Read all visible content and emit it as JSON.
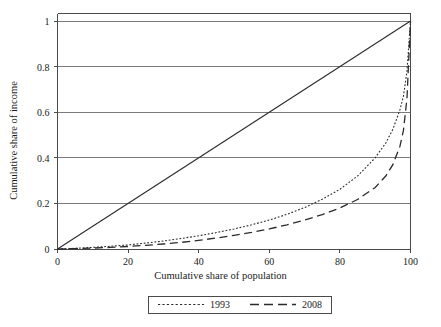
{
  "chart_data": {
    "type": "line",
    "title": "",
    "xlabel": "Cumulative share of population",
    "ylabel": "Cumulative share of income",
    "xlim": [
      0,
      100
    ],
    "ylim": [
      0,
      1
    ],
    "xticks": [
      "0",
      "20",
      "40",
      "60",
      "80",
      "100"
    ],
    "xtick_values": [
      0,
      20,
      40,
      60,
      80,
      100
    ],
    "yticks": [
      "0",
      "0.2",
      "0.4",
      "0.6",
      "0.8",
      "1"
    ],
    "ytick_values": [
      0,
      0.2,
      0.4,
      0.6,
      0.8,
      1
    ],
    "grid": "horizontal",
    "legend_position": "below-axes",
    "series": [
      {
        "name": "equality-line",
        "label": "",
        "style": "solid",
        "color": "#2b2b2b",
        "x": [
          0,
          100
        ],
        "values": [
          0,
          1
        ]
      },
      {
        "name": "1993",
        "label": "1993",
        "style": "dotted",
        "color": "#2b2b2b",
        "x": [
          0,
          5,
          10,
          15,
          20,
          25,
          30,
          35,
          40,
          45,
          50,
          55,
          60,
          65,
          70,
          75,
          80,
          85,
          90,
          93,
          95,
          97,
          98,
          99,
          100
        ],
        "values": [
          0,
          0.003,
          0.007,
          0.012,
          0.018,
          0.026,
          0.035,
          0.046,
          0.058,
          0.072,
          0.088,
          0.106,
          0.127,
          0.152,
          0.182,
          0.218,
          0.262,
          0.32,
          0.4,
          0.465,
          0.525,
          0.61,
          0.67,
          0.78,
          1
        ]
      },
      {
        "name": "2008",
        "label": "2008",
        "style": "dashed",
        "color": "#2b2b2b",
        "x": [
          0,
          5,
          10,
          15,
          20,
          25,
          30,
          35,
          40,
          45,
          50,
          55,
          60,
          65,
          70,
          75,
          80,
          85,
          90,
          93,
          95,
          97,
          98,
          99,
          100
        ],
        "values": [
          0,
          0.002,
          0.004,
          0.007,
          0.011,
          0.016,
          0.022,
          0.029,
          0.038,
          0.048,
          0.06,
          0.073,
          0.088,
          0.106,
          0.127,
          0.151,
          0.18,
          0.217,
          0.27,
          0.32,
          0.37,
          0.45,
          0.52,
          0.66,
          1
        ]
      }
    ]
  },
  "axes": {
    "x_title": "Cumulative share of population",
    "y_title": "Cumulative share of income",
    "x_tick_labels": [
      "0",
      "20",
      "40",
      "60",
      "80",
      "100"
    ],
    "y_tick_labels": [
      "0",
      "0.2",
      "0.4",
      "0.6",
      "0.8",
      "1"
    ]
  },
  "legend": {
    "entries": [
      {
        "label": "1993",
        "style": "dotted"
      },
      {
        "label": "2008",
        "style": "dashed"
      }
    ]
  },
  "colors": {
    "line": "#2b2b2b",
    "grid": "#7a7a7a",
    "frame": "#4a4a4a",
    "background": "#ffffff",
    "text": "#1a1a1a"
  }
}
